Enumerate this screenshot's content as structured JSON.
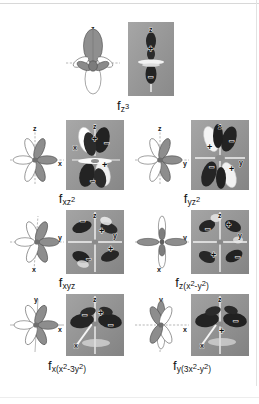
{
  "figure": {
    "background_color": "#ffffff",
    "photo_panel_color": "#9a9a9a",
    "lobe_positive_color": "#8c8c8c",
    "lobe_negative_color": "#ffffff",
    "axis_color": "#8a8a8a"
  },
  "rows": [
    {
      "name": "row-1",
      "cells": [
        {
          "id": "fz3",
          "caption_plain": "f z3",
          "label_f": "f",
          "label_sub": "z",
          "label_sup": "3",
          "line_axes": [
            "z"
          ],
          "photo_axes": [
            "z"
          ],
          "photo_signs": [
            "+",
            "-"
          ]
        }
      ]
    },
    {
      "name": "row-2",
      "cells": [
        {
          "id": "fxz2",
          "caption_plain": "f xz2",
          "label_f": "f",
          "label_sub": "xz",
          "label_sup": "2",
          "line_axes": [
            "z",
            "x"
          ],
          "photo_axes": [
            "z",
            "x"
          ],
          "photo_signs": [
            "+",
            "-",
            "+",
            "-"
          ]
        },
        {
          "id": "fyz2",
          "caption_plain": "f yz2",
          "label_f": "f",
          "label_sub": "yz",
          "label_sup": "2",
          "line_axes": [
            "z",
            "y"
          ],
          "photo_axes": [
            "z",
            "y"
          ],
          "photo_signs": [
            "+",
            "-",
            "+",
            "-"
          ]
        }
      ]
    },
    {
      "name": "row-3",
      "cells": [
        {
          "id": "fxyz",
          "caption_plain": "f xyz",
          "label_f": "f",
          "label_sub": "xyz",
          "label_sup": "",
          "line_axes": [
            "y",
            "x"
          ],
          "photo_axes": [
            "z",
            "y"
          ],
          "photo_signs": [
            "+",
            "-",
            "+",
            "-"
          ]
        },
        {
          "id": "fzx2y2",
          "caption_plain": "f z(x2-y2)",
          "label_f": "f",
          "label_sub": "z(x",
          "label_sup": "2",
          "label_sub2": "-y",
          "label_sup2": "2",
          "label_tail": ")",
          "line_axes": [
            "y",
            "x"
          ],
          "photo_axes": [
            "z",
            "y"
          ],
          "photo_signs": [
            "+",
            "-",
            "+",
            "-"
          ]
        }
      ]
    },
    {
      "name": "row-4",
      "cells": [
        {
          "id": "fxx23y2",
          "caption_plain": "f x(x2-3y2)",
          "label_f": "f",
          "label_sub": "x(x",
          "label_sup": "2",
          "label_sub2": "-3y",
          "label_sup2": "2",
          "label_tail": ")",
          "line_axes": [
            "y",
            "x"
          ],
          "photo_axes": [
            "z",
            "x"
          ],
          "photo_signs": [
            "-",
            "+",
            "-"
          ]
        },
        {
          "id": "fy3x2y2",
          "caption_plain": "f y(3x2-y2)",
          "label_f": "f",
          "label_sub": "y(3x",
          "label_sup": "2",
          "label_sub2": "-y",
          "label_sup2": "2",
          "label_tail": ")",
          "line_axes": [
            "y",
            "x"
          ],
          "photo_axes": [
            "z",
            "x"
          ],
          "photo_signs": [
            "+",
            "-"
          ]
        }
      ]
    }
  ],
  "axis_glyphs": {
    "x": "x",
    "y": "y",
    "z": "z"
  },
  "signs": {
    "plus": "+",
    "minus": "−"
  }
}
